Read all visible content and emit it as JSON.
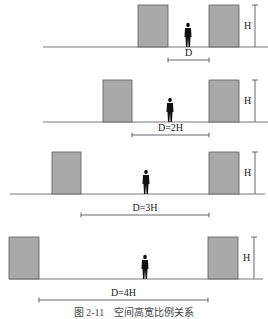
{
  "colors": {
    "building_fill": "#a9a9a9",
    "building_stroke": "#5a5a5a",
    "ground": "#7a7a7a",
    "person": "#111111",
    "dimension": "#555555"
  },
  "panels": [
    {
      "id": 1,
      "ground_y": 47,
      "ground_x1": 43,
      "ground_x2": 268,
      "top_y": 5,
      "left_building": [
        138,
        168
      ],
      "right_building": [
        209,
        239
      ],
      "person_x": 185,
      "dim_y": 60,
      "dim_x1": 168,
      "dim_x2": 209,
      "h_label": "H",
      "d_label": "D"
    },
    {
      "id": 2,
      "ground_y": 122,
      "ground_x1": 43,
      "ground_x2": 268,
      "top_y": 80,
      "left_building": [
        103,
        132
      ],
      "right_building": [
        209,
        239
      ],
      "person_x": 167,
      "dim_y": 135,
      "dim_x1": 132,
      "dim_x2": 209,
      "h_label": "H",
      "d_label": "D=2H"
    },
    {
      "id": 3,
      "ground_y": 194,
      "ground_x1": 10,
      "ground_x2": 265,
      "top_y": 152,
      "left_building": [
        52,
        81
      ],
      "right_building": [
        209,
        239
      ],
      "person_x": 143,
      "dim_y": 215,
      "dim_x1": 81,
      "dim_x2": 209,
      "h_label": "H",
      "d_label": "D=3H"
    },
    {
      "id": 4,
      "ground_y": 279,
      "ground_x1": 9,
      "ground_x2": 263,
      "top_y": 237,
      "left_building": [
        9,
        39
      ],
      "right_building": [
        208,
        238
      ],
      "person_x": 142,
      "dim_y": 300,
      "dim_x1": 39,
      "dim_x2": 208,
      "h_label": "H",
      "d_label": "D=4H"
    }
  ],
  "caption": "图 2-11　空间高宽比例关系"
}
